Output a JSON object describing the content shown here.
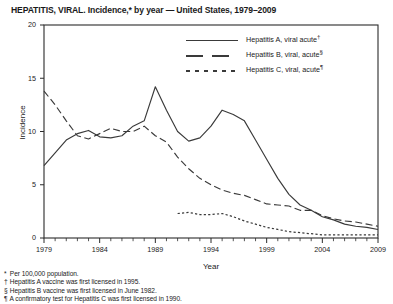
{
  "title": "HEPATITIS, VIRAL. Incidence,* by year — United States, 1979–2009",
  "axis": {
    "x_title": "Year",
    "y_title": "Incidence",
    "y_ticks": [
      "0",
      "5",
      "10",
      "15",
      "20"
    ],
    "x_ticks": [
      "1979",
      "1984",
      "1989",
      "1994",
      "1999",
      "2004",
      "2009"
    ]
  },
  "legend": [
    {
      "label": "Hepatitis A, viral acute",
      "marker": "†",
      "style": "solid",
      "name": "legend-hepatitis-a"
    },
    {
      "label": "Hepatitis B, viral, acute",
      "marker": "§",
      "style": "dashed",
      "name": "legend-hepatitis-b"
    },
    {
      "label": "Hepatitis C, viral, acute",
      "marker": "¶",
      "style": "dotted",
      "name": "legend-hepatitis-c"
    }
  ],
  "footnotes": [
    {
      "mark": "*",
      "text": "Per 100,000 population."
    },
    {
      "mark": "†",
      "text": "Hepatitis A vaccine was first licensed in 1995."
    },
    {
      "mark": "§",
      "text": "Hepatitis B vaccine was first licensed in June 1982."
    },
    {
      "mark": "¶",
      "text": "A confirmatory test for Hepatitis C was first licensed in 1990."
    }
  ],
  "chart_data": {
    "type": "line",
    "title": "HEPATITIS, VIRAL. Incidence,* by year — United States, 1979–2009",
    "xlabel": "Year",
    "ylabel": "Incidence",
    "xlim": [
      1979,
      2009
    ],
    "ylim": [
      0,
      20
    ],
    "grid": false,
    "legend_position": "top-right",
    "x": [
      1979,
      1980,
      1981,
      1982,
      1983,
      1984,
      1985,
      1986,
      1987,
      1988,
      1989,
      1990,
      1991,
      1992,
      1993,
      1994,
      1995,
      1996,
      1997,
      1998,
      1999,
      2000,
      2001,
      2002,
      2003,
      2004,
      2005,
      2006,
      2007,
      2008,
      2009
    ],
    "series": [
      {
        "name": "Hepatitis A, viral acute",
        "style": "solid",
        "color": "#3a3a3a",
        "values": [
          6.8,
          8.0,
          9.2,
          9.8,
          10.1,
          9.5,
          9.4,
          9.6,
          10.5,
          11.0,
          14.2,
          12.0,
          10.0,
          9.1,
          9.4,
          10.5,
          12.0,
          11.6,
          11.0,
          9.2,
          7.4,
          5.6,
          4.1,
          3.1,
          2.6,
          2.0,
          1.7,
          1.3,
          1.1,
          1.0,
          0.8
        ]
      },
      {
        "name": "Hepatitis B, viral, acute",
        "style": "dashed",
        "color": "#3a3a3a",
        "values": [
          13.8,
          12.5,
          11.0,
          9.6,
          9.3,
          9.8,
          10.3,
          10.0,
          10.0,
          10.5,
          9.6,
          9.0,
          7.6,
          6.5,
          5.6,
          5.0,
          4.5,
          4.2,
          4.0,
          3.6,
          3.2,
          3.1,
          3.0,
          2.6,
          2.6,
          2.1,
          1.8,
          1.6,
          1.5,
          1.3,
          1.1
        ]
      },
      {
        "name": "Hepatitis C, viral, acute",
        "style": "dotted",
        "color": "#3a3a3a",
        "values": [
          null,
          null,
          null,
          null,
          null,
          null,
          null,
          null,
          null,
          null,
          null,
          null,
          2.3,
          2.4,
          2.2,
          2.2,
          2.3,
          2.0,
          1.6,
          1.3,
          1.0,
          0.8,
          0.6,
          0.5,
          0.4,
          0.3,
          0.3,
          0.3,
          0.3,
          0.3,
          0.3
        ]
      }
    ]
  }
}
